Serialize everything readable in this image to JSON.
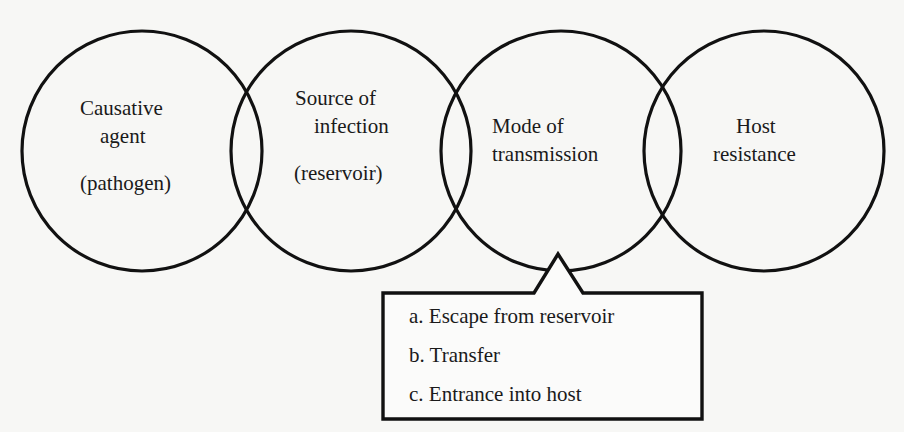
{
  "diagram": {
    "type": "chain-of-infection",
    "circles": [
      {
        "lines": [
          "Causative",
          "agent"
        ],
        "sub": "(pathogen)"
      },
      {
        "lines": [
          "Source of",
          "infection"
        ],
        "sub": "(reservoir)"
      },
      {
        "lines": [
          "Mode of",
          "transmission"
        ],
        "sub": ""
      },
      {
        "lines": [
          "Host",
          "resistance"
        ],
        "sub": ""
      }
    ],
    "callout": {
      "attached_to": "Mode of transmission",
      "items": [
        "a. Escape from reservoir",
        "b. Transfer",
        "c. Entrance into host"
      ]
    },
    "colors": {
      "stroke": "#111111",
      "background": "#f7f7f5",
      "text": "#1a1a1a"
    }
  }
}
